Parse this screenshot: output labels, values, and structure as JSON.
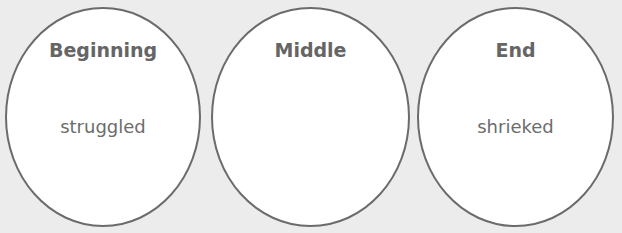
{
  "diagram": {
    "colors": {
      "background": "#ececec",
      "oval_fill": "#ffffff",
      "oval_stroke": "#6b6b6b",
      "title_text": "#656565",
      "word_text": "#6c6c6c"
    },
    "ovals": [
      {
        "title": "Beginning",
        "word": "struggled"
      },
      {
        "title": "Middle",
        "word": ""
      },
      {
        "title": "End",
        "word": "shrieked"
      }
    ]
  }
}
